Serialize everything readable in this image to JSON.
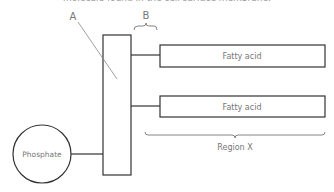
{
  "caption": "molecule found in the cell surface membrane.",
  "labels": {
    "a": "A",
    "b": "B",
    "region_x": "Region X"
  },
  "phosphate": {
    "label": "Phosphate"
  },
  "fatty_acids": [
    {
      "label": "Fatty acid"
    },
    {
      "label": "Fatty acid"
    }
  ],
  "colors": {
    "stroke": "#333333",
    "label": "#777777",
    "pointer": "#888888"
  }
}
